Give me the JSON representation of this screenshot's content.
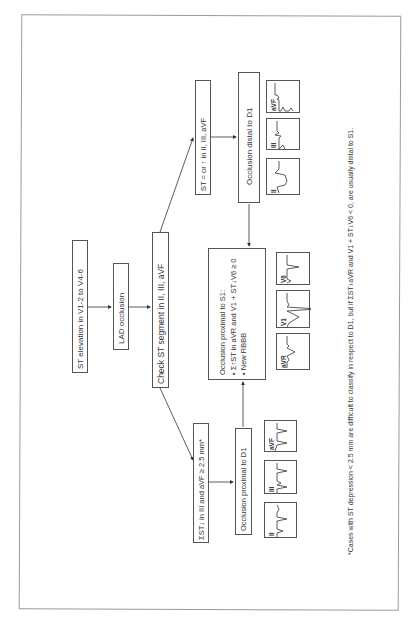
{
  "diagram": {
    "orientation": "rotated 90 degrees counter-clockwise",
    "nodes": {
      "st_elevation": "ST elevation in V1-2 to V4-6",
      "lad_occlusion": "LAD occlusion",
      "check_st": "Check ST segment in II, III, aVF",
      "st_equal_or_up": "ST = or ↑ in II, III, aVF",
      "occlusion_distal_d1": "Occlusion distal to D1",
      "sum_st_down": "ΣST↓ in III and aVF ≥ 2.5 mm*",
      "occlusion_proximal_d1": "Occlusion proximal to D1",
      "occlusion_proximal_s1": {
        "title": "Occlusion proximal to S1:",
        "bullets": [
          "Σ↑ST in aVR and V1 + ST↓V6 ≥ 0",
          "New RBBB"
        ]
      }
    },
    "ecg_groups": {
      "distal_d1_leads": [
        "II",
        "III",
        "aVF"
      ],
      "proximal_s1_leads": [
        "aVR",
        "V1",
        "V6"
      ],
      "proximal_d1_leads": [
        "II",
        "III",
        "aVF"
      ]
    },
    "footnote": "*Cases with ST depression < 2.5 mm are difficult to classify in respect to D1, but if ΣST↑aVR and V1 + ST↓V6 < 0, are usually distal to S1."
  }
}
